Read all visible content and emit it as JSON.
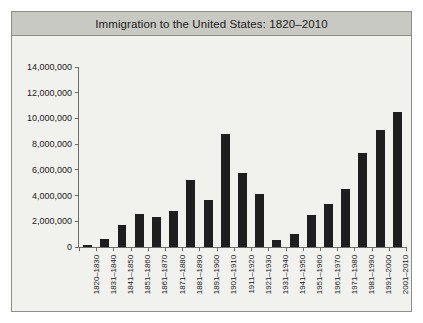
{
  "chart_data": {
    "type": "bar",
    "title": "Immigration to the United States: 1820–2010",
    "xlabel": "",
    "ylabel": "",
    "ylim": [
      0,
      14000000
    ],
    "grid": false,
    "legend": null,
    "y_ticks": [
      "0",
      "2,000,000",
      "4,000,000",
      "6,000,000",
      "8,000,000",
      "10,000,000",
      "12,000,000",
      "14,000,000"
    ],
    "y_tick_values": [
      0,
      2000000,
      4000000,
      6000000,
      8000000,
      10000000,
      12000000,
      14000000
    ],
    "categories": [
      "1820–1830",
      "1831–1840",
      "1841–1850",
      "1851–1860",
      "1861–1870",
      "1871–1880",
      "1881–1890",
      "1891–1900",
      "1901–1910",
      "1911–1920",
      "1921–1930",
      "1931–1940",
      "1941–1950",
      "1951–1960",
      "1961–1970",
      "1971–1980",
      "1981–1990",
      "1991–2000",
      "2001–2010"
    ],
    "values": [
      152000,
      599000,
      1713000,
      2598000,
      2315000,
      2812000,
      5247000,
      3688000,
      8795000,
      5736000,
      4107000,
      528000,
      1035000,
      2515000,
      3322000,
      4493000,
      7338000,
      9095000,
      10501000
    ],
    "bar_color": "#1e1e1e",
    "plot_background": "#f1f1ee",
    "title_band_color": "#c9c9c4",
    "frame_color": "#8e8e88"
  }
}
